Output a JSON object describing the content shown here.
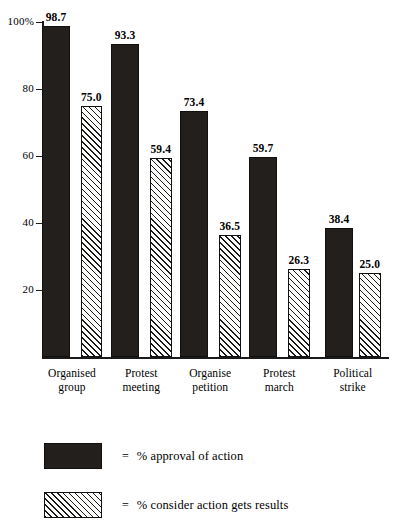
{
  "chart_data": {
    "type": "bar",
    "title": "",
    "subtitle": "",
    "xlabel": "",
    "ylabel": "",
    "ylim": [
      0,
      100
    ],
    "grid": false,
    "legend_position": "bottom-left",
    "y_ticks": [
      {
        "value": 100,
        "label": "100%"
      },
      {
        "value": 80,
        "label": "80"
      },
      {
        "value": 60,
        "label": "60"
      },
      {
        "value": 40,
        "label": "40"
      },
      {
        "value": 20,
        "label": "20"
      }
    ],
    "categories": [
      {
        "line1": "Organised",
        "line2": "group"
      },
      {
        "line1": "Protest",
        "line2": "meeting"
      },
      {
        "line1": "Organise",
        "line2": "petition"
      },
      {
        "line1": "Protest",
        "line2": "march"
      },
      {
        "line1": "Political",
        "line2": "strike"
      }
    ],
    "series": [
      {
        "name": "% approval of action",
        "style": "solid",
        "color": "#231f1c",
        "values": [
          98.7,
          93.3,
          73.4,
          59.7,
          38.4
        ],
        "labels": [
          "98.7",
          "93.3",
          "73.4",
          "59.7",
          "38.4"
        ]
      },
      {
        "name": "% consider action gets results",
        "style": "hatched",
        "color": "#ffffff",
        "values": [
          75.0,
          59.4,
          36.5,
          26.3,
          25.0
        ],
        "labels": [
          "75.0",
          "59.4",
          "36.5",
          "26.3",
          "25.0"
        ]
      }
    ]
  },
  "legend": {
    "equals_sign": "=",
    "entries": [
      {
        "swatch": "solid",
        "label": "% approval of action"
      },
      {
        "swatch": "hatched",
        "label": "% consider action gets results"
      }
    ]
  }
}
